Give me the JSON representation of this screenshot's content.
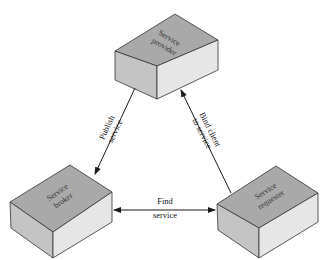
{
  "diagram": {
    "nodes": [
      {
        "id": "provider",
        "label_line1": "Service",
        "label_line2": "provider"
      },
      {
        "id": "broker",
        "label_line1": "Service",
        "label_line2": "broker"
      },
      {
        "id": "requester",
        "label_line1": "Service",
        "label_line2": "requester"
      }
    ],
    "edges": [
      {
        "from": "provider",
        "to": "broker",
        "label_line1": "Publish",
        "label_line2": "service",
        "direction": "to-broker"
      },
      {
        "from": "requester",
        "to": "provider",
        "label_line1": "Bind client",
        "label_line2": "to service",
        "direction": "to-provider"
      },
      {
        "from": "broker",
        "to": "requester",
        "label_line1": "Find",
        "label_line2": "service",
        "direction": "bidirectional"
      }
    ],
    "colors": {
      "top_face": "#a9a9a9",
      "left_face": "#c4c4c4",
      "right_face": "#e6e6e6",
      "edge_line": "#1a1a1a"
    }
  }
}
